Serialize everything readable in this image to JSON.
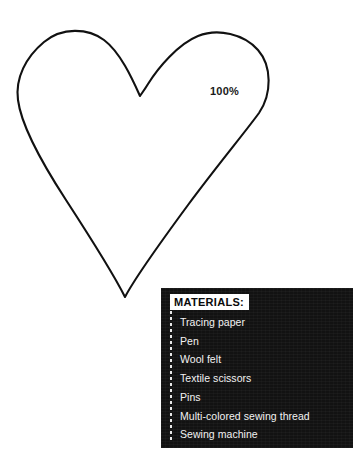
{
  "page": {
    "background_color": "#ffffff",
    "width": 363,
    "height": 473
  },
  "pattern": {
    "shape_name": "heart",
    "outline_color": "#111111",
    "fill": "none",
    "scale_label": "100%"
  },
  "materials": {
    "heading": "MATERIALS:",
    "box_color": "#121212",
    "text_color": "#f2f2f2",
    "heading_background": "#ffffff",
    "heading_text_color": "#0a0a0a",
    "items": [
      "Tracing paper",
      "Pen",
      "Wool felt",
      "Textile scissors",
      "Pins",
      "Multi-colored sewing thread",
      "Sewing machine"
    ]
  }
}
